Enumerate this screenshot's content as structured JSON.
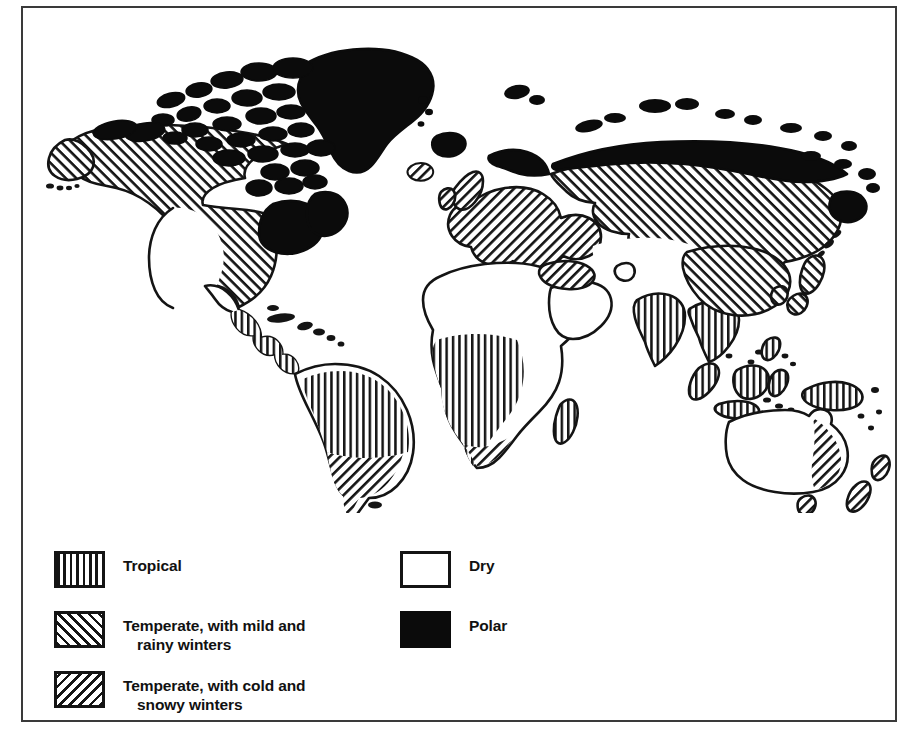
{
  "figure": {
    "frame_color": "#3a3a3a",
    "ink_color": "#141414",
    "background_color": "#ffffff"
  },
  "map": {
    "projection_note": "world map, all continents",
    "regions": [
      {
        "name": "Greenland",
        "climate": "Polar",
        "fill": "solid"
      },
      {
        "name": "Canadian Arctic Archipelago",
        "climate": "Polar",
        "fill": "solid"
      },
      {
        "name": "Northern Canada and Alaska coast",
        "climate": "Polar",
        "fill": "solid"
      },
      {
        "name": "Arctic Siberia",
        "climate": "Polar",
        "fill": "solid"
      },
      {
        "name": "Iceland",
        "climate": "Polar",
        "fill": "solid"
      },
      {
        "name": "Svalbard",
        "climate": "Polar",
        "fill": "solid"
      },
      {
        "name": "Canada and northern United States",
        "climate": "Temperate, with cold and snowy winters",
        "fill": "diagonal-down"
      },
      {
        "name": "Eastern United States",
        "climate": "Temperate, with cold and snowy winters",
        "fill": "diagonal-down"
      },
      {
        "name": "Western Europe",
        "climate": "Temperate, with mild and rainy winters",
        "fill": "diagonal-up"
      },
      {
        "name": "British Isles",
        "climate": "Temperate, with mild and rainy winters",
        "fill": "diagonal-up"
      },
      {
        "name": "Mediterranean coast",
        "climate": "Temperate, with mild and rainy winters",
        "fill": "diagonal-up"
      },
      {
        "name": "Russia and Siberia",
        "climate": "Temperate, with cold and snowy winters",
        "fill": "diagonal-down"
      },
      {
        "name": "Northern China, Korea and Japan",
        "climate": "Temperate, with cold and snowy winters",
        "fill": "diagonal-down"
      },
      {
        "name": "Amazon basin and northern South America",
        "climate": "Tropical",
        "fill": "vertical"
      },
      {
        "name": "Central America",
        "climate": "Tropical",
        "fill": "vertical"
      },
      {
        "name": "Central Africa",
        "climate": "Tropical",
        "fill": "vertical"
      },
      {
        "name": "India and Southeast Asia",
        "climate": "Tropical",
        "fill": "vertical"
      },
      {
        "name": "Indonesia and New Guinea",
        "climate": "Tropical",
        "fill": "vertical"
      },
      {
        "name": "Southern South America",
        "climate": "Temperate, with mild and rainy winters",
        "fill": "diagonal-up"
      },
      {
        "name": "Southern Africa coast",
        "climate": "Temperate, with mild and rainy winters",
        "fill": "diagonal-up"
      },
      {
        "name": "Eastern Australia and New Zealand",
        "climate": "Temperate, with mild and rainy winters",
        "fill": "diagonal-up"
      },
      {
        "name": "Sahara and North Africa",
        "climate": "Dry",
        "fill": "blank"
      },
      {
        "name": "Arabian Peninsula",
        "climate": "Dry",
        "fill": "blank"
      },
      {
        "name": "Central Asia",
        "climate": "Dry",
        "fill": "blank"
      },
      {
        "name": "Western United States and Mexico",
        "climate": "Dry",
        "fill": "blank"
      },
      {
        "name": "Interior Australia",
        "climate": "Dry",
        "fill": "blank"
      }
    ]
  },
  "legend": {
    "columns": [
      {
        "items": [
          {
            "pattern": "vertical",
            "label_line1": "Tropical",
            "label_line2": ""
          },
          {
            "pattern": "diagonal-up",
            "label_line1": "Temperate, with mild and",
            "label_line2": "rainy winters"
          },
          {
            "pattern": "diagonal-down",
            "label_line1": "Temperate, with cold and",
            "label_line2": "snowy winters"
          }
        ]
      },
      {
        "items": [
          {
            "pattern": "blank",
            "label_line1": "Dry",
            "label_line2": ""
          },
          {
            "pattern": "solid",
            "label_line1": "Polar",
            "label_line2": ""
          }
        ]
      }
    ]
  }
}
